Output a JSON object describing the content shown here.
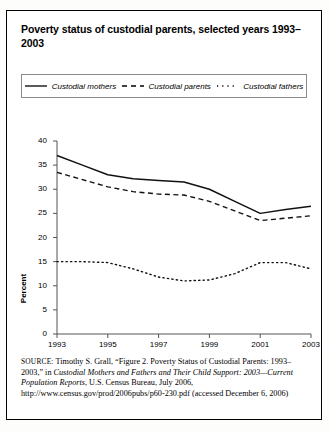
{
  "figure": {
    "title": "Poverty status of custodial parents, selected years 1993–2003",
    "source_prefix": "SOURCE:",
    "source_text_1": " Timothy S. Grall, “Figure 2. Poverty Status of Custodial Parents: 1993–2003,” in ",
    "source_italic_1": "Custodial Mothers and Fathers and Their Child Support: 2003—Current Population Reports",
    "source_text_2": ", U.S. Census Bureau, July 2006, http://www.census.gov/prod/2006pubs/p60-230.pdf (accessed December 6, 2006)"
  },
  "legend": {
    "items": [
      {
        "label": "Custodial mothers",
        "style": "solid",
        "key_name": "solid-line-key"
      },
      {
        "label": "Custodial parents",
        "style": "dashed",
        "key_name": "dashed-line-key"
      },
      {
        "label": "Custodial fathers",
        "style": "dotted",
        "key_name": "dotted-line-key"
      }
    ]
  },
  "chart_data": {
    "type": "line",
    "title": "Poverty status of custodial parents, selected years 1993–2003",
    "xlabel": "",
    "ylabel": "Percent",
    "ylim": [
      0,
      40
    ],
    "ytick_values": [
      0,
      5,
      10,
      15,
      20,
      25,
      30,
      35,
      40
    ],
    "xlim": [
      1993,
      2003
    ],
    "xtick_labels": [
      "1993",
      "1995",
      "1997",
      "1999",
      "2001",
      "2003"
    ],
    "grid": false,
    "legend_position": "top",
    "x": [
      1993,
      1994,
      1995,
      1996,
      1997,
      1998,
      1999,
      2000,
      2001,
      2002,
      2003
    ],
    "series": [
      {
        "name": "Custodial mothers",
        "style": "solid",
        "values": [
          37.0,
          35.0,
          33.0,
          32.2,
          31.8,
          31.5,
          30.0,
          27.5,
          25.0,
          25.8,
          26.5
        ]
      },
      {
        "name": "Custodial parents",
        "style": "dashed",
        "values": [
          33.5,
          32.0,
          30.5,
          29.5,
          29.0,
          28.8,
          27.5,
          25.5,
          23.5,
          24.0,
          24.5
        ]
      },
      {
        "name": "Custodial fathers",
        "style": "dotted",
        "values": [
          15.0,
          15.0,
          14.8,
          13.5,
          11.8,
          11.0,
          11.2,
          12.5,
          14.8,
          14.8,
          13.5
        ]
      }
    ]
  }
}
